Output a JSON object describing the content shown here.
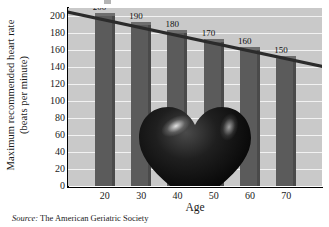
{
  "chart_data": {
    "type": "bar",
    "title": "",
    "xlabel": "Age",
    "ylabel": "Maximum recommended heart rate (beats per minute)",
    "ylabel_line1": "Maximum recommended heart rate",
    "ylabel_line2": "(beats per minute)",
    "categories": [
      "20",
      "30",
      "40",
      "50",
      "60",
      "70"
    ],
    "values": [
      200,
      190,
      180,
      170,
      160,
      150
    ],
    "data_labels": [
      "200",
      "190",
      "180",
      "170",
      "160",
      "150"
    ],
    "series": [
      {
        "name": "Maximum recommended heart rate",
        "values": [
          200,
          190,
          180,
          170,
          160,
          150
        ]
      }
    ],
    "trend_line": {
      "type": "line",
      "description": "descending straight line across tops of bars",
      "start_value": 207,
      "end_value": 143
    },
    "ylim": [
      0,
      210
    ],
    "yticks": [
      "0",
      "20",
      "40",
      "60",
      "80",
      "100",
      "120",
      "140",
      "160",
      "180",
      "200"
    ],
    "ytick_values": [
      0,
      20,
      40,
      60,
      80,
      100,
      120,
      140,
      160,
      180,
      200
    ],
    "xticks": [
      "20",
      "30",
      "40",
      "50",
      "60",
      "70"
    ],
    "xtick_values": [
      20,
      30,
      40,
      50,
      60,
      70
    ],
    "grid": true,
    "legend": false,
    "legend_position": "none",
    "colors": {
      "plot_background": "#c9c9c9",
      "bar_fill": "#5b5b5b",
      "bar_top": "#6e6e6e",
      "bar_side": "#4a4a4a",
      "gridline": "#f2f2f2",
      "trend_line": "#2b2b2b",
      "axis": "#000000",
      "text": "#1a1a1a",
      "heart": "#0d0d0d",
      "page_background": "#ffffff"
    },
    "decoration": {
      "name": "heart-illustration",
      "description": "glossy black three-dimensional heart centered over the plot area"
    }
  },
  "footer": {
    "source_keyword": "Source:",
    "source_text": "The American Geriatric Society"
  }
}
